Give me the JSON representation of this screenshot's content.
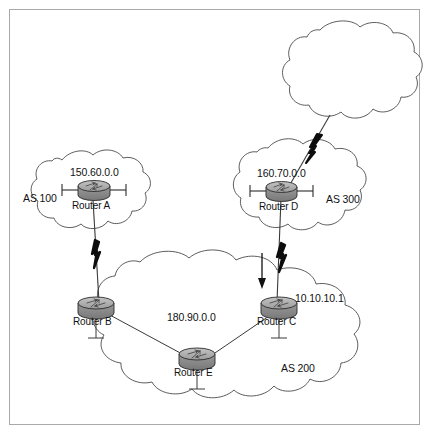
{
  "diagram": {
    "frame": {
      "border_color": "#a9a9a9",
      "background": "#ffffff"
    },
    "palette": {
      "cloud_stroke": "#4a4a4a",
      "line_stroke": "#3a3a3a",
      "router_body": "#8f8f8f",
      "router_top": "#b5b5b5",
      "router_stroke": "#2b2b2b",
      "bolt_fill": "#0d0d0d",
      "text": "#111111"
    },
    "clouds": [
      {
        "id": "cloud-internet",
        "label": "",
        "as_label": "",
        "network": ""
      },
      {
        "id": "cloud-as100",
        "label": "AS 100",
        "as_label": "AS 100",
        "network": "150.60.0.0"
      },
      {
        "id": "cloud-as300",
        "label": "AS 300",
        "as_label": "AS 300",
        "network": "160.70.0.0"
      },
      {
        "id": "cloud-as200",
        "label": "AS 200",
        "as_label": "AS 200",
        "network": "180.90.0.0"
      }
    ],
    "routers": [
      {
        "id": "router-a",
        "name": "Router A",
        "as": "AS 100",
        "network": "150.60.0.0"
      },
      {
        "id": "router-b",
        "name": "Router B",
        "as": "AS 200",
        "network": "180.90.0.0"
      },
      {
        "id": "router-c",
        "name": "Router C",
        "as": "AS 200",
        "network": "10.10.10.1"
      },
      {
        "id": "router-d",
        "name": "Router D",
        "as": "AS 300",
        "network": "160.70.0.0"
      },
      {
        "id": "router-e",
        "name": "Router E",
        "as": "AS 200",
        "network": "180.90.0.0"
      }
    ],
    "labels": {
      "as100": "AS 100",
      "as200": "AS 200",
      "as300": "AS 300",
      "net_150": "150.60.0.0",
      "net_160": "160.70.0.0",
      "net_180": "180.90.0.0",
      "addr_10": "10.10.10.1",
      "router_a": "Router A",
      "router_b": "Router B",
      "router_c": "Router C",
      "router_d": "Router D",
      "router_e": "Router E"
    },
    "links": [
      {
        "id": "link-internet-d",
        "from": "cloud-internet",
        "to": "router-d",
        "type": "serial-lightning"
      },
      {
        "id": "link-a-b",
        "from": "router-a",
        "to": "router-b",
        "type": "serial-lightning"
      },
      {
        "id": "link-d-c",
        "from": "router-d",
        "to": "router-c",
        "type": "serial-lightning"
      },
      {
        "id": "link-b-e",
        "from": "router-b",
        "to": "router-e",
        "type": "plain"
      },
      {
        "id": "link-e-c",
        "from": "router-e",
        "to": "router-c",
        "type": "plain"
      }
    ],
    "annotations": [
      {
        "id": "direction-arrow",
        "type": "down-arrow",
        "near": "router-c"
      }
    ]
  }
}
